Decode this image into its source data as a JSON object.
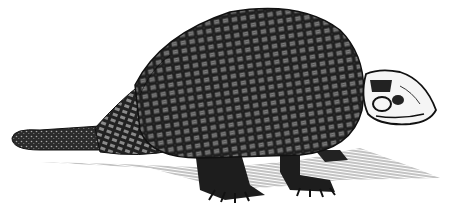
{
  "image": {
    "subject": "glyptodon engraving",
    "style": "black-and-white woodcut / engraving illustration",
    "background_color": "#ffffff",
    "ink_color": "#1a1a1a",
    "parts": [
      "tail",
      "tail-rings",
      "carapace",
      "head",
      "front-leg",
      "hind-leg",
      "ground-shadow"
    ]
  }
}
